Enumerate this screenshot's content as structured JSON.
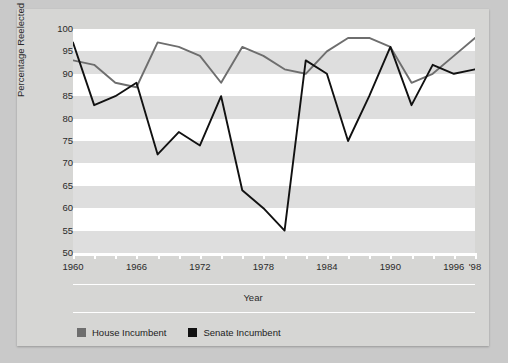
{
  "chart_data": {
    "type": "line",
    "title": "",
    "xlabel": "Year",
    "ylabel": "Percentage Reelected",
    "ylim": [
      50,
      100
    ],
    "ytick_labels": [
      "100",
      "95",
      "90",
      "85",
      "80",
      "75",
      "70",
      "65",
      "60",
      "55",
      "50"
    ],
    "yticks": [
      100,
      95,
      90,
      85,
      80,
      75,
      70,
      65,
      60,
      55,
      50
    ],
    "xlim": [
      1960,
      1998
    ],
    "x": [
      1960,
      1962,
      1964,
      1966,
      1968,
      1970,
      1972,
      1974,
      1976,
      1978,
      1980,
      1982,
      1984,
      1986,
      1988,
      1990,
      1992,
      1994,
      1996,
      1998
    ],
    "xtick_labels": [
      "1960",
      "1966",
      "1972",
      "1978",
      "1984",
      "1990",
      "1996",
      "'98"
    ],
    "xtick_values": [
      1960,
      1966,
      1972,
      1978,
      1984,
      1990,
      1996,
      1998
    ],
    "grid": "horizontal-bands",
    "legend_position": "bottom-left",
    "series": [
      {
        "name": "House Incumbent",
        "color": "#6e6e6e",
        "values": [
          93,
          92,
          88,
          87,
          97,
          96,
          94,
          88,
          96,
          94,
          91,
          90,
          95,
          98,
          98,
          96,
          88,
          90,
          94,
          98
        ]
      },
      {
        "name": "Senate Incumbent",
        "color": "#111111",
        "values": [
          97,
          83,
          85,
          88,
          72,
          77,
          74,
          85,
          64,
          60,
          55,
          93,
          90,
          75,
          85,
          96,
          83,
          92,
          90,
          91
        ]
      }
    ]
  },
  "axis": {
    "y_title": "Percentage Reelected",
    "x_title": "Year"
  },
  "legend": {
    "items": [
      {
        "label": "House Incumbent",
        "swatch": "house-swatch",
        "color": "#6e6e6e"
      },
      {
        "label": "Senate Incumbent",
        "swatch": "senate-swatch",
        "color": "#111111"
      }
    ]
  },
  "colors": {
    "page_background": "#c9c9c9",
    "figure_background": "#d6d6d4",
    "band_light": "#ffffff",
    "band_shade": "#dedede",
    "house_line": "#6e6e6e",
    "senate_line": "#111111",
    "axis": "#ffffff",
    "text": "#2a2a2a"
  }
}
